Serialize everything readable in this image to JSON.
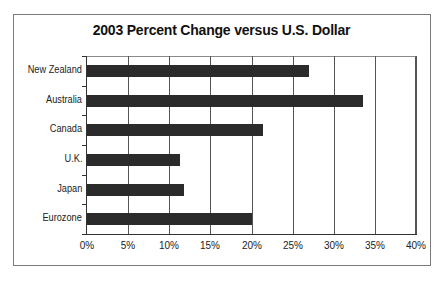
{
  "chart_data": {
    "type": "bar",
    "orientation": "horizontal",
    "title": "2003 Percent Change versus U.S. Dollar",
    "xlabel": "",
    "ylabel": "",
    "categories": [
      "New Zealand",
      "Australia",
      "Canada",
      "U.K.",
      "Japan",
      "Eurozone"
    ],
    "values": [
      27,
      33.6,
      21.4,
      11.3,
      11.8,
      20
    ],
    "value_unit": "%",
    "xlim": [
      0,
      40
    ],
    "x_ticks": [
      "0%",
      "5%",
      "10%",
      "15%",
      "20%",
      "25%",
      "30%",
      "35%",
      "40%"
    ],
    "grid": true,
    "legend": "none",
    "bar_color": "#2b2b2b"
  },
  "labels": {
    "title": "2003 Percent Change versus U.S. Dollar",
    "categories": [
      "New Zealand",
      "Australia",
      "Canada",
      "U.K.",
      "Japan",
      "Eurozone"
    ],
    "ticks": [
      "0%",
      "5%",
      "10%",
      "15%",
      "20%",
      "25%",
      "30%",
      "35%",
      "40%"
    ]
  }
}
